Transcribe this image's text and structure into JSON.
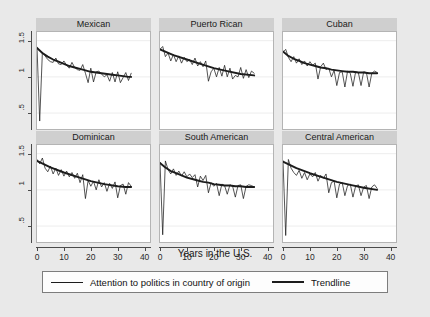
{
  "chart_data": {
    "type": "line",
    "title": "",
    "xlabel": "Years in the U.S.",
    "ylabel": "",
    "xlim": [
      0,
      42
    ],
    "ylim": [
      0.28,
      1.62
    ],
    "xticks": [
      0,
      10,
      20,
      30,
      40
    ],
    "yticks": [
      0.5,
      1,
      1.5
    ],
    "xtick_labels": [
      "0",
      "10",
      "20",
      "30",
      "40"
    ],
    "ytick_labels": [
      ".5",
      "1",
      "1.5"
    ],
    "grid": "horizontal-faint",
    "legend_position": "bottom",
    "legend": [
      {
        "name": "Attention to politics in country of origin",
        "style": "thin",
        "color": "#1c1c1c"
      },
      {
        "name": "Trendline",
        "style": "thick",
        "color": "#1c1c1c"
      }
    ],
    "layout": {
      "rows": 2,
      "cols": 3
    },
    "panels": [
      {
        "title": "Mexican",
        "row": 0,
        "col": 0,
        "series": [
          {
            "name": "Attention to politics in country of origin",
            "style": "thin",
            "x": [
              0,
              1,
              2,
              3,
              4,
              5,
              6,
              7,
              8,
              9,
              10,
              11,
              12,
              13,
              14,
              15,
              16,
              17,
              18,
              19,
              20,
              21,
              22,
              23,
              24,
              25,
              26,
              27,
              28,
              29,
              30,
              31,
              32,
              33,
              34,
              35
            ],
            "y": [
              1.41,
              0.39,
              1.34,
              1.29,
              1.24,
              1.21,
              1.2,
              1.26,
              1.18,
              1.17,
              1.22,
              1.16,
              1.12,
              1.2,
              1.13,
              1.1,
              1.09,
              1.17,
              1.05,
              0.92,
              1.12,
              0.93,
              1.07,
              1.08,
              1.04,
              1.0,
              1.03,
              0.94,
              1.06,
              0.93,
              1.07,
              0.92,
              0.99,
              1.06,
              0.95,
              1.05
            ]
          },
          {
            "name": "Trendline",
            "style": "thick",
            "x": [
              0,
              2,
              4,
              6,
              8,
              10,
              12,
              14,
              16,
              18,
              20,
              22,
              24,
              26,
              28,
              30,
              32,
              34,
              35
            ],
            "y": [
              1.4,
              1.33,
              1.28,
              1.24,
              1.21,
              1.18,
              1.15,
              1.13,
              1.11,
              1.09,
              1.07,
              1.06,
              1.05,
              1.04,
              1.03,
              1.02,
              1.01,
              1.0,
              1.0
            ]
          }
        ]
      },
      {
        "title": "Puerto Rican",
        "row": 0,
        "col": 1,
        "series": [
          {
            "name": "Attention to politics in country of origin",
            "style": "thin",
            "x": [
              0,
              1,
              2,
              3,
              4,
              5,
              6,
              7,
              8,
              9,
              10,
              11,
              12,
              13,
              14,
              15,
              16,
              17,
              18,
              19,
              20,
              21,
              22,
              23,
              24,
              25,
              26,
              27,
              28,
              29,
              30,
              31,
              32,
              33,
              34,
              35
            ],
            "y": [
              1.38,
              1.42,
              1.28,
              1.33,
              1.22,
              1.31,
              1.21,
              1.29,
              1.19,
              1.27,
              1.21,
              1.24,
              1.17,
              1.26,
              1.15,
              1.21,
              1.14,
              1.22,
              0.94,
              1.07,
              1.12,
              1.0,
              1.13,
              1.01,
              1.16,
              1.0,
              1.12,
              0.97,
              1.02,
              1.0,
              1.13,
              0.98,
              1.1,
              0.99,
              1.08,
              1.05
            ]
          },
          {
            "name": "Trendline",
            "style": "thick",
            "x": [
              0,
              5,
              10,
              15,
              20,
              25,
              30,
              35
            ],
            "y": [
              1.38,
              1.3,
              1.24,
              1.18,
              1.12,
              1.08,
              1.04,
              1.02
            ]
          }
        ]
      },
      {
        "title": "Cuban",
        "row": 0,
        "col": 2,
        "series": [
          {
            "name": "Attention to politics in country of origin",
            "style": "thin",
            "x": [
              0,
              1,
              2,
              3,
              4,
              5,
              6,
              7,
              8,
              9,
              10,
              11,
              12,
              13,
              14,
              15,
              16,
              17,
              18,
              19,
              20,
              21,
              22,
              23,
              24,
              25,
              26,
              27,
              28,
              29,
              30,
              31,
              32,
              33,
              34,
              35
            ],
            "y": [
              1.34,
              1.38,
              1.27,
              1.21,
              1.28,
              1.19,
              1.25,
              1.17,
              1.22,
              1.15,
              1.21,
              1.16,
              1.19,
              0.97,
              1.14,
              1.19,
              1.1,
              1.12,
              1.0,
              1.09,
              0.88,
              1.06,
              1.07,
              0.86,
              1.08,
              1.05,
              0.87,
              1.07,
              1.06,
              0.88,
              1.07,
              1.06,
              0.86,
              1.05,
              1.08,
              1.06
            ]
          },
          {
            "name": "Trendline",
            "style": "thick",
            "x": [
              0,
              2,
              4,
              6,
              8,
              10,
              12,
              14,
              16,
              18,
              20,
              22,
              24,
              26,
              28,
              30,
              32,
              34,
              35
            ],
            "y": [
              1.35,
              1.29,
              1.25,
              1.22,
              1.19,
              1.17,
              1.15,
              1.13,
              1.12,
              1.1,
              1.09,
              1.08,
              1.07,
              1.07,
              1.06,
              1.06,
              1.05,
              1.05,
              1.05
            ]
          }
        ]
      },
      {
        "title": "Dominican",
        "row": 1,
        "col": 0,
        "series": [
          {
            "name": "Attention to politics in country of origin",
            "style": "thin",
            "x": [
              0,
              1,
              2,
              3,
              4,
              5,
              6,
              7,
              8,
              9,
              10,
              11,
              12,
              13,
              14,
              15,
              16,
              17,
              18,
              19,
              20,
              21,
              22,
              23,
              24,
              25,
              26,
              27,
              28,
              29,
              30,
              31,
              32,
              33,
              34,
              35
            ],
            "y": [
              1.42,
              1.36,
              1.44,
              1.3,
              1.25,
              1.33,
              1.22,
              1.3,
              1.2,
              1.28,
              1.19,
              1.26,
              1.18,
              1.24,
              1.16,
              1.23,
              1.1,
              1.21,
              0.88,
              1.13,
              1.05,
              1.12,
              1.0,
              1.14,
              1.04,
              1.1,
              0.98,
              1.09,
              1.02,
              1.11,
              0.89,
              1.06,
              1.08,
              0.94,
              1.1,
              1.05
            ]
          },
          {
            "name": "Trendline",
            "style": "thick",
            "x": [
              0,
              5,
              10,
              15,
              20,
              25,
              30,
              33,
              35
            ],
            "y": [
              1.4,
              1.31,
              1.24,
              1.18,
              1.12,
              1.08,
              1.05,
              1.04,
              1.04
            ]
          }
        ]
      },
      {
        "title": "South American",
        "row": 1,
        "col": 1,
        "series": [
          {
            "name": "Attention to politics in country of origin",
            "style": "thin",
            "x": [
              0,
              1,
              2,
              3,
              4,
              5,
              6,
              7,
              8,
              9,
              10,
              11,
              12,
              13,
              14,
              15,
              16,
              17,
              18,
              19,
              20,
              21,
              22,
              23,
              24,
              25,
              26,
              27,
              28,
              29,
              30,
              31,
              32,
              33,
              34,
              35
            ],
            "y": [
              1.38,
              0.38,
              1.4,
              1.28,
              1.22,
              1.29,
              1.2,
              1.26,
              1.19,
              1.25,
              1.18,
              1.22,
              1.17,
              1.21,
              1.04,
              1.19,
              1.13,
              1.2,
              0.96,
              1.1,
              1.05,
              1.09,
              0.92,
              1.08,
              1.06,
              0.94,
              1.07,
              1.05,
              0.9,
              1.06,
              1.07,
              0.88,
              1.05,
              1.07,
              1.06,
              1.04
            ]
          },
          {
            "name": "Trendline",
            "style": "thick",
            "x": [
              0,
              2,
              4,
              6,
              8,
              10,
              12,
              14,
              16,
              18,
              20,
              22,
              24,
              26,
              28,
              30,
              32,
              34,
              35
            ],
            "y": [
              1.37,
              1.31,
              1.26,
              1.23,
              1.2,
              1.17,
              1.15,
              1.13,
              1.11,
              1.1,
              1.08,
              1.07,
              1.06,
              1.06,
              1.05,
              1.05,
              1.04,
              1.04,
              1.04
            ]
          }
        ]
      },
      {
        "title": "Central American",
        "row": 1,
        "col": 2,
        "series": [
          {
            "name": "Attention to politics in country of origin",
            "style": "thin",
            "x": [
              0,
              1,
              2,
              3,
              4,
              5,
              6,
              7,
              8,
              9,
              10,
              11,
              12,
              13,
              14,
              15,
              16,
              17,
              18,
              19,
              20,
              21,
              22,
              23,
              24,
              25,
              26,
              27,
              28,
              29,
              30,
              31,
              32,
              33,
              34,
              35
            ],
            "y": [
              1.4,
              0.37,
              1.42,
              1.3,
              1.24,
              1.2,
              1.27,
              1.16,
              1.24,
              1.14,
              1.22,
              1.18,
              1.24,
              1.12,
              1.2,
              1.16,
              1.22,
              0.96,
              1.1,
              1.12,
              0.89,
              1.08,
              1.1,
              0.92,
              1.06,
              1.08,
              0.9,
              1.05,
              1.07,
              0.92,
              1.04,
              1.06,
              0.88,
              1.04,
              1.07,
              1.02
            ]
          },
          {
            "name": "Trendline",
            "style": "thick",
            "x": [
              0,
              5,
              10,
              15,
              20,
              25,
              30,
              35
            ],
            "y": [
              1.39,
              1.3,
              1.23,
              1.17,
              1.11,
              1.07,
              1.03,
              1.0
            ]
          }
        ]
      }
    ]
  }
}
